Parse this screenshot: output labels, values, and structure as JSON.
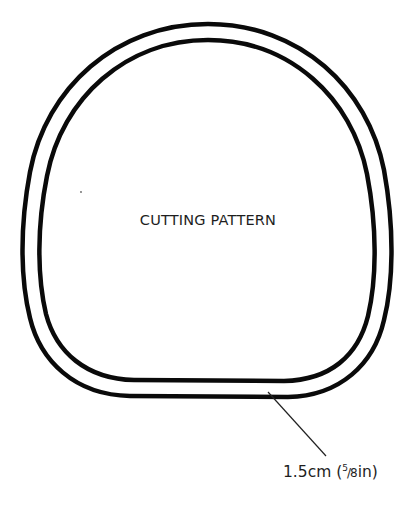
{
  "diagram": {
    "title": "CUTTING PATTERN",
    "seam_allowance": {
      "value_text": "1.5cm (",
      "fraction_numerator": "5",
      "fraction_slash": "/",
      "fraction_denominator": "8",
      "unit_suffix": "in)",
      "full_text": "1.5cm (5/8in)"
    },
    "shape": "rounded bag/pouch outline with inner seam line",
    "colors": {
      "line": "#0a0a0a",
      "background": "#ffffff",
      "text": "#1e1e1e"
    }
  }
}
